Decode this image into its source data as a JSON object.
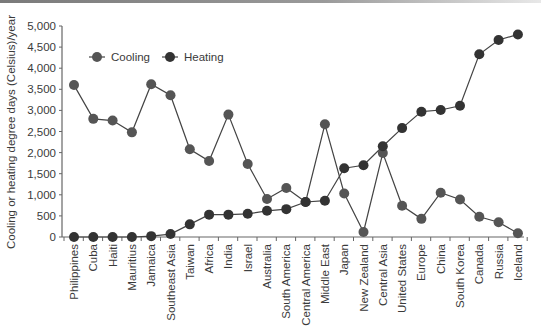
{
  "chart_data": {
    "type": "line",
    "title": "",
    "xlabel": "",
    "ylabel": "Cooling or heating degree days (Celsius)/year",
    "ylim": [
      0,
      5000
    ],
    "yticks": [
      0,
      500,
      1000,
      1500,
      2000,
      2500,
      3000,
      3500,
      4000,
      4500,
      5000
    ],
    "ytick_labels": [
      "0",
      "500",
      "1,000",
      "1,500",
      "2,000",
      "2,500",
      "3,000",
      "3,500",
      "4,000",
      "4,500",
      "5,000"
    ],
    "grid": false,
    "legend_position": "upper-left inside",
    "categories": [
      "Philippines",
      "Cuba",
      "Haiti",
      "Mauritius",
      "Jamaica",
      "Southeast Asia",
      "Taiwan",
      "Africa",
      "India",
      "Israel",
      "Australia",
      "South America",
      "Central America",
      "Middle East",
      "Japan",
      "New Zealand",
      "Central Asia",
      "United States",
      "Europe",
      "China",
      "South Korea",
      "Canada",
      "Russia",
      "Iceland"
    ],
    "series": [
      {
        "name": "Cooling",
        "color": "#555555",
        "values": [
          3600,
          2800,
          2760,
          2480,
          3620,
          3360,
          2080,
          1800,
          2900,
          1730,
          900,
          1160,
          830,
          2670,
          1030,
          120,
          1990,
          740,
          430,
          1050,
          890,
          480,
          350,
          90
        ]
      },
      {
        "name": "Heating",
        "color": "#333333",
        "values": [
          0,
          0,
          0,
          0,
          20,
          70,
          300,
          530,
          530,
          550,
          620,
          660,
          830,
          860,
          1630,
          1700,
          2150,
          2580,
          2970,
          3010,
          3110,
          4330,
          4670,
          4800
        ]
      }
    ]
  },
  "legend": {
    "items": [
      "Cooling",
      "Heating"
    ]
  },
  "axis": {
    "ylabel": "Cooling or heating degree days (Celsius)/year"
  }
}
